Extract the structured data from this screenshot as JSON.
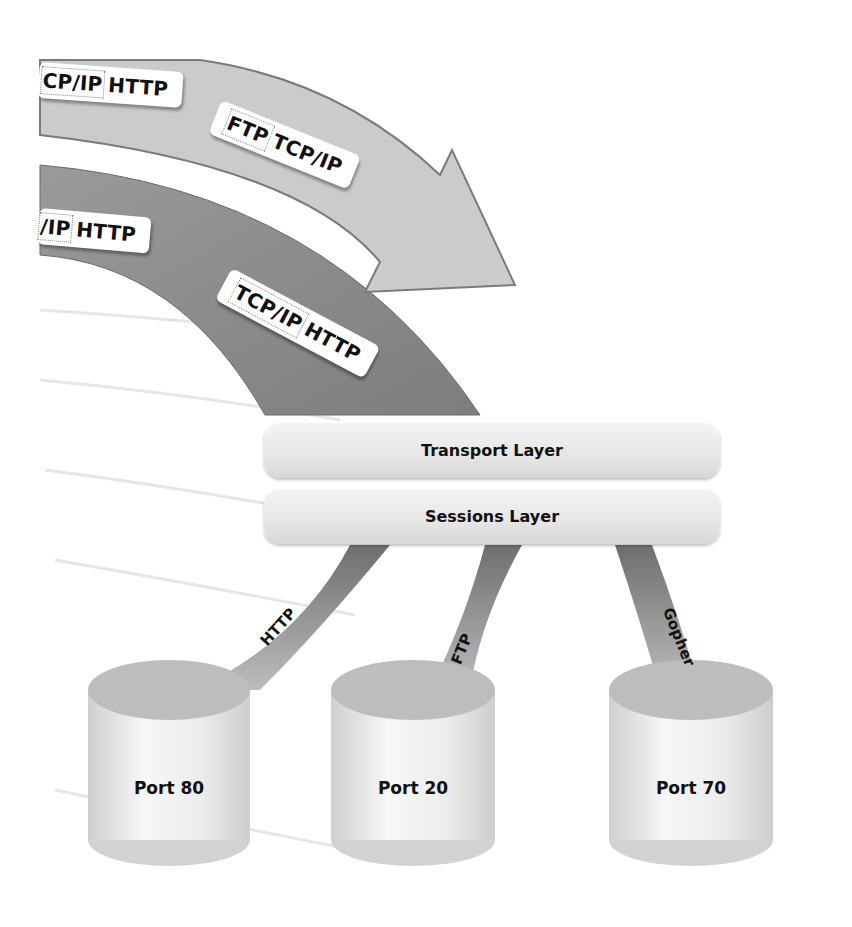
{
  "diagram": {
    "top_arrow": {
      "labels": [
        {
          "first": "CP/IP",
          "second": "HTTP"
        },
        {
          "first": "FTP",
          "second": "TCP/IP"
        }
      ],
      "color": "#c9c9c9"
    },
    "bottom_band": {
      "labels": [
        {
          "first": "/IP",
          "second": "HTTP"
        },
        {
          "first": "TCP/IP",
          "second": "HTTP"
        }
      ],
      "color": "#8a8a8a"
    },
    "layers": [
      {
        "label": "Transport Layer"
      },
      {
        "label": "Sessions Layer"
      }
    ],
    "ribbons": [
      {
        "label": "HTTP"
      },
      {
        "label": "FTP"
      },
      {
        "label": "Gopher"
      }
    ],
    "ports": [
      {
        "label": "Port 80"
      },
      {
        "label": "Port 20"
      },
      {
        "label": "Port 70"
      }
    ]
  }
}
